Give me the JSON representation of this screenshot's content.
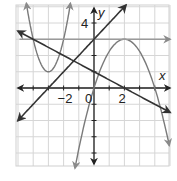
{
  "chart_data": {
    "type": "line",
    "title": "",
    "xlabel": "x",
    "ylabel": "y",
    "xlim": [
      -5.2,
      5
    ],
    "ylim": [
      -4.8,
      5.1
    ],
    "grid": true,
    "grid_step": 1,
    "x_tick_labels": [
      {
        "value": -2,
        "label": "−2"
      },
      {
        "value": 0,
        "label": "0"
      },
      {
        "value": 2,
        "label": "2"
      }
    ],
    "y_tick_labels": [
      {
        "value": 4,
        "label": "4"
      }
    ],
    "series": [
      {
        "name": "f(x) = 2(x+3)^2 + 1",
        "kind": "parabola_up",
        "color": "#7a7a7a",
        "vertex": [
          -3,
          1
        ],
        "a": 2,
        "x_range": [
          -4.45,
          -1.55
        ]
      },
      {
        "name": "g(x) = -0.75(x-2)^2 + 3",
        "kind": "parabola_down",
        "color": "#7a7a7a",
        "vertex": [
          2,
          3
        ],
        "a": -0.75,
        "x_range": [
          -1.25,
          4.95
        ],
        "x_intercepts": [
          0,
          4
        ]
      },
      {
        "name": "y = 3",
        "kind": "horizontal_line",
        "color": "#9a9a9a",
        "y": 3,
        "x_range": [
          -4.9,
          5
        ]
      },
      {
        "name": "y = x + 3",
        "kind": "line",
        "color": "#333333",
        "slope": 1,
        "intercept": 3,
        "x_range": [
          -5,
          2.1
        ]
      },
      {
        "name": "y = -0.5x + 1",
        "kind": "line",
        "color": "#333333",
        "slope": -0.5,
        "intercept": 1,
        "x_range": [
          -5,
          5
        ]
      }
    ]
  },
  "axes": {
    "x_label": "x",
    "y_label": "y"
  }
}
